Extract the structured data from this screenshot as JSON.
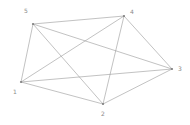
{
  "figure": {
    "background_color": "#ffffff",
    "edge_color": "#999999",
    "vertex_color": "#808080",
    "label_color": "#8a8a8a"
  },
  "chart_data": {
    "type": "diagram",
    "graph_type": "undirected-simple-graph",
    "title": "",
    "xlabel": "",
    "ylabel": "",
    "grid": false,
    "legend": null,
    "node_count": 5,
    "edge_count": 10,
    "nodes": [
      {
        "id": "1",
        "label": "1",
        "x": 21,
        "y": 82,
        "label_x": 13,
        "label_y": 89,
        "degree": 4
      },
      {
        "id": "2",
        "label": "2",
        "x": 103,
        "y": 104,
        "label_x": 101,
        "label_y": 111,
        "degree": 4
      },
      {
        "id": "3",
        "label": "3",
        "x": 172,
        "y": 69,
        "label_x": 178,
        "label_y": 66,
        "degree": 4
      },
      {
        "id": "4",
        "label": "4",
        "x": 124,
        "y": 16,
        "label_x": 130,
        "label_y": 9,
        "degree": 4
      },
      {
        "id": "5",
        "label": "5",
        "x": 33,
        "y": 24,
        "label_x": 24,
        "label_y": 8,
        "degree": 4
      }
    ],
    "edges": [
      {
        "source": "1",
        "target": "2"
      },
      {
        "source": "1",
        "target": "3"
      },
      {
        "source": "1",
        "target": "4"
      },
      {
        "source": "1",
        "target": "5"
      },
      {
        "source": "2",
        "target": "3"
      },
      {
        "source": "2",
        "target": "4"
      },
      {
        "source": "2",
        "target": "5"
      },
      {
        "source": "3",
        "target": "4"
      },
      {
        "source": "3",
        "target": "5"
      },
      {
        "source": "4",
        "target": "5"
      }
    ]
  }
}
